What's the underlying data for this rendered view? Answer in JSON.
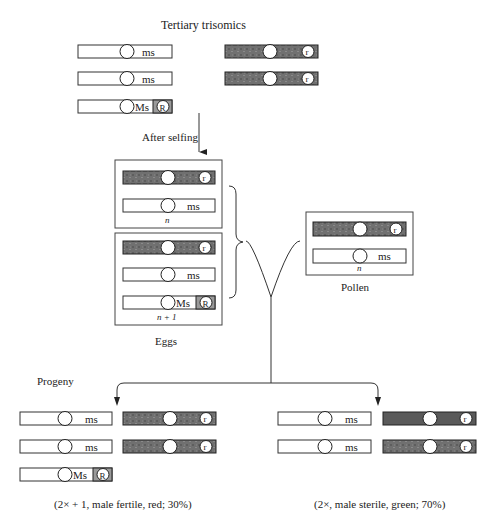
{
  "title": "Tertiary trisomics",
  "parents": {
    "left": [
      {
        "type": "normal",
        "gene": "ms"
      },
      {
        "type": "normal",
        "gene": "ms"
      },
      {
        "type": "translocation",
        "gene": "Ms",
        "marker": "R"
      }
    ],
    "right": [
      {
        "type": "marker",
        "marker": "r"
      },
      {
        "type": "marker",
        "marker": "r"
      }
    ]
  },
  "step_label": "After selfing",
  "eggs": {
    "label": "Eggs",
    "groups": [
      {
        "ploidy_label": "n",
        "chromosomes": [
          {
            "type": "marker",
            "marker": "r"
          },
          {
            "type": "normal",
            "gene": "ms"
          }
        ]
      },
      {
        "ploidy_label": "n + 1",
        "chromosomes": [
          {
            "type": "marker",
            "marker": "r"
          },
          {
            "type": "normal",
            "gene": "ms"
          },
          {
            "type": "translocation",
            "gene": "Ms",
            "marker": "R"
          }
        ]
      }
    ]
  },
  "pollen": {
    "label": "Pollen",
    "ploidy_label": "n",
    "chromosomes": [
      {
        "type": "marker",
        "marker": "r"
      },
      {
        "type": "normal",
        "gene": "ms"
      }
    ]
  },
  "progeny": {
    "label": "Progeny",
    "left": {
      "caption": "(2× + 1, male fertile, red; 30%)",
      "genes": [
        "ms",
        "ms",
        "Ms"
      ],
      "markers": [
        "r",
        "r"
      ],
      "translocation_marker": "R"
    },
    "right": {
      "caption": "(2×, male sterile, green; 70%)",
      "genes": [
        "ms",
        "ms"
      ],
      "markers": [
        "r",
        "r"
      ]
    }
  },
  "colors": {
    "dark_chromosome": "#6e6e6e",
    "shade_segment": "#9a9a9a",
    "line": "#333333"
  }
}
